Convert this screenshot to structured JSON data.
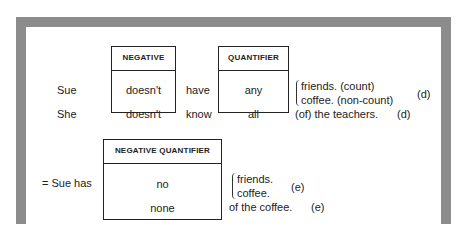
{
  "frame": {
    "border_color": "#8c8c8c"
  },
  "section_d": {
    "negative_box": {
      "header": "NEGATIVE",
      "rows": [
        "doesn't",
        "doesn't"
      ]
    },
    "quantifier_box": {
      "header": "QUANTIFIER",
      "rows": [
        "any",
        "all"
      ]
    },
    "rows": [
      {
        "subject": "Sue",
        "verb": "have",
        "objects": [
          "friends. (count)",
          "coffee.  (non-count)"
        ],
        "label": "(d)"
      },
      {
        "subject": "She",
        "verb": "know",
        "object": "(of) the teachers.",
        "label": "(d)"
      }
    ]
  },
  "section_e": {
    "lead": "=  Sue has",
    "negative_quantifier_box": {
      "header": "NEGATIVE QUANTIFIER",
      "rows": [
        "no",
        "none"
      ]
    },
    "rows": [
      {
        "objects": [
          "friends.",
          "coffee."
        ],
        "label": "(e)"
      },
      {
        "object": "of the coffee.",
        "label": "(e)"
      }
    ]
  }
}
